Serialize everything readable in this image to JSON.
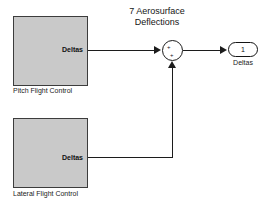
{
  "diagram": {
    "title_line1": "7 Aerosurface",
    "title_line2": "Deflections",
    "blocks": {
      "pitch": {
        "caption": "Pitch Flight Control",
        "port_label": "Deltas"
      },
      "lateral": {
        "caption": "Lateral Flight Control",
        "port_label": "Deltas"
      }
    },
    "sum_block": {
      "sign_1": "+",
      "sign_2": "+"
    },
    "outport": {
      "number": "1",
      "caption": "Deltas"
    },
    "colors": {
      "block_fill": "#c9c9c9",
      "block_border": "#3c3c3c",
      "line": "#1c1c1c",
      "background": "#ffffff",
      "text": "#111111"
    }
  }
}
